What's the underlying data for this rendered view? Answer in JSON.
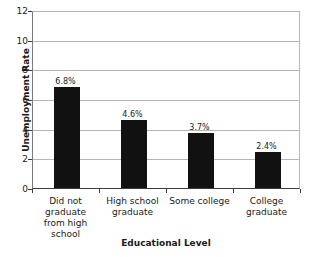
{
  "chart_data": {
    "type": "bar",
    "title": "",
    "xlabel": "Educational Level",
    "ylabel": "Unemployment Rate",
    "categories": [
      "Did not graduate from high school",
      "High school graduate",
      "Some college",
      "College graduate"
    ],
    "category_lines": [
      [
        "Did not",
        "graduate",
        "from high",
        "school"
      ],
      [
        "High school",
        "graduate"
      ],
      [
        "Some college"
      ],
      [
        "College",
        "graduate"
      ]
    ],
    "values": [
      6.8,
      4.6,
      3.7,
      2.4
    ],
    "data_labels": [
      "6.8%",
      "4.6%",
      "3.7%",
      "2.4%"
    ],
    "ylim": [
      0,
      12
    ],
    "yticks": [
      0,
      2,
      4,
      6,
      8,
      10,
      12
    ],
    "ytick_labels": [
      "0",
      "2",
      "4",
      "6",
      "8",
      "10",
      "12"
    ],
    "grid": true,
    "legend": false,
    "bar_color": "#111111",
    "gridline_color": "#b5b5b5",
    "axis_color": "#3d3d3d",
    "background_color": "#ffffff"
  }
}
